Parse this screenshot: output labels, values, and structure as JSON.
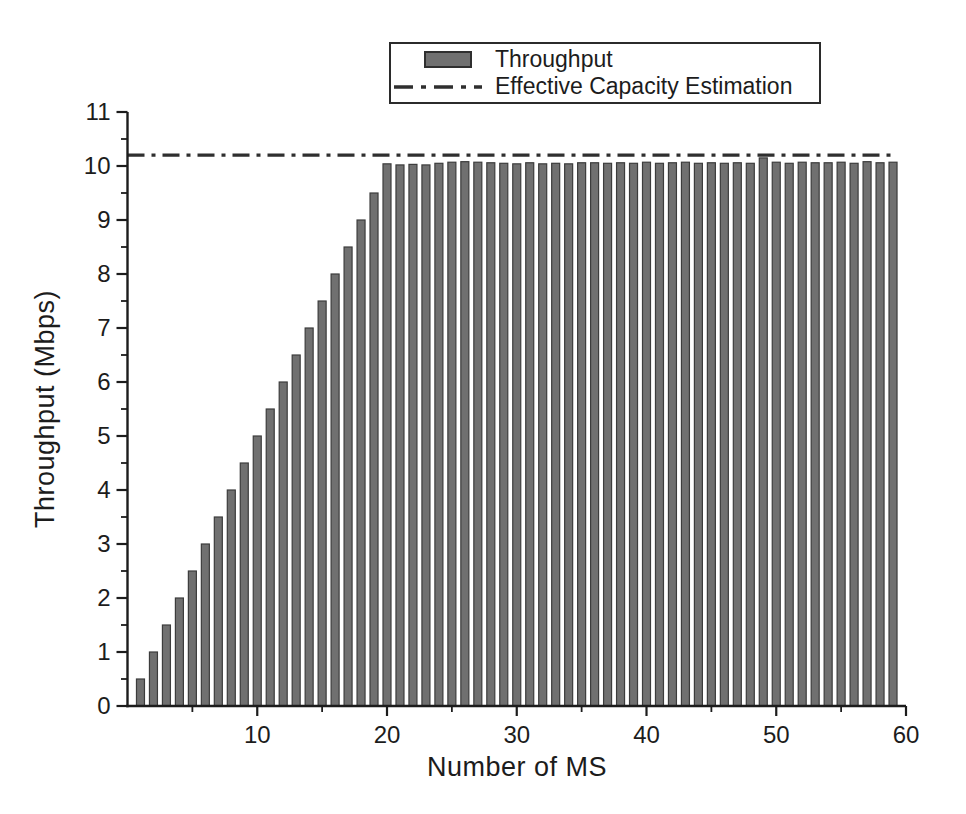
{
  "chart_data": {
    "type": "bar",
    "title": "",
    "xlabel": "Number of MS",
    "ylabel": "Throughput (Mbps)",
    "xlim": [
      0,
      60
    ],
    "ylim": [
      0,
      11
    ],
    "xticks_major": [
      10,
      20,
      30,
      40,
      50,
      60
    ],
    "xticks_minor": [
      5,
      15,
      25,
      35,
      45,
      55
    ],
    "yticks_major": [
      0,
      1,
      2,
      3,
      4,
      5,
      6,
      7,
      8,
      9,
      10,
      11
    ],
    "yticks_minor_step": 0.5,
    "grid": "off",
    "legend_position": "top-center",
    "x": [
      1,
      2,
      3,
      4,
      5,
      6,
      7,
      8,
      9,
      10,
      11,
      12,
      13,
      14,
      15,
      16,
      17,
      18,
      19,
      20,
      21,
      22,
      23,
      24,
      25,
      26,
      27,
      28,
      29,
      30,
      31,
      32,
      33,
      34,
      35,
      36,
      37,
      38,
      39,
      40,
      41,
      42,
      43,
      44,
      45,
      46,
      47,
      48,
      49,
      50,
      51,
      52,
      53,
      54,
      55,
      56,
      57,
      58,
      59
    ],
    "series": [
      {
        "name": "Throughput",
        "values": [
          0.5,
          1.0,
          1.5,
          2.0,
          2.5,
          3.0,
          3.5,
          4.0,
          4.5,
          5.0,
          5.5,
          6.0,
          6.5,
          7.0,
          7.5,
          8.0,
          8.5,
          9.0,
          9.5,
          10.04,
          10.02,
          10.03,
          10.02,
          10.05,
          10.07,
          10.08,
          10.07,
          10.06,
          10.05,
          10.04,
          10.06,
          10.04,
          10.05,
          10.04,
          10.06,
          10.06,
          10.05,
          10.06,
          10.05,
          10.07,
          10.05,
          10.06,
          10.07,
          10.05,
          10.06,
          10.05,
          10.06,
          10.05,
          10.15,
          10.07,
          10.05,
          10.07,
          10.06,
          10.06,
          10.07,
          10.05,
          10.08,
          10.06,
          10.07
        ]
      }
    ],
    "capacity_line_value": 10.2,
    "legend": [
      {
        "label": "Throughput",
        "marker": "bar-swatch"
      },
      {
        "label": "Effective Capacity Estimation",
        "marker": "dash-dot-line"
      }
    ],
    "colors": {
      "bar_fill": "#707070",
      "bar_edge": "#3c3c3c",
      "capacity_line": "#2f2f2f",
      "axis": "#1c1c1c",
      "text": "#1c1c1c",
      "background": "#ffffff"
    }
  }
}
